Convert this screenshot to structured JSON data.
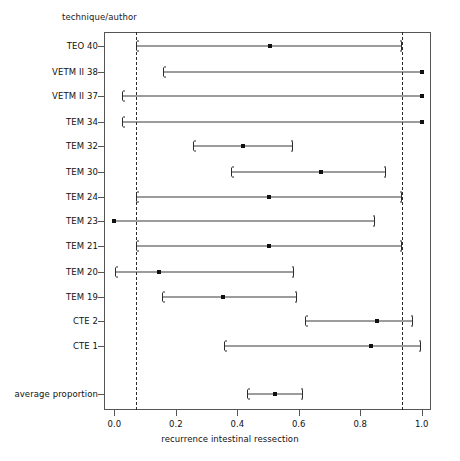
{
  "chart_data": {
    "type": "scatter",
    "title": "",
    "ylabel": "technique/author",
    "xlabel": "recurrence intestinal ressection",
    "xlim": [
      -0.034,
      1.034
    ],
    "xticks": [
      0.0,
      0.2,
      0.4,
      0.6,
      0.8,
      1.0
    ],
    "xtick_labels": [
      "0.0",
      "0.2",
      "0.4",
      "0.6",
      "0.8",
      "1.0"
    ],
    "grid": false,
    "legend": "none",
    "reference_lines": [
      0.07,
      0.936
    ],
    "reference_line_style": "dashed",
    "marker": "filled-square",
    "interval_style": "bracket-capped-line",
    "categories": [
      "TEO 40",
      "VETM II 38",
      "VETM II 37",
      "TEM 34",
      "TEM 32",
      "TEM 30",
      "TEM 24",
      "TEM 23",
      "TEM 21",
      "TEM 20",
      "TEM 19",
      "CTE 2",
      "CTE 1",
      "average proportion"
    ],
    "rows": [
      {
        "label": "TEO 40",
        "estimate": 0.505,
        "low": 0.07,
        "high": 0.935,
        "y": 46.0,
        "cap_low": true,
        "cap_high": true
      },
      {
        "label": "VETM II 38",
        "estimate": 1.0,
        "low": 0.159,
        "high": 1.0,
        "y": 71.7,
        "cap_low": true,
        "cap_high": false
      },
      {
        "label": "VETM II 37",
        "estimate": 1.0,
        "low": 0.026,
        "high": 1.0,
        "y": 96.0,
        "cap_low": true,
        "cap_high": false
      },
      {
        "label": "TEM 34",
        "estimate": 1.0,
        "low": 0.025,
        "high": 1.0,
        "y": 122.3,
        "cap_low": true,
        "cap_high": false
      },
      {
        "label": "TEM 32",
        "estimate": 0.418,
        "low": 0.256,
        "high": 0.582,
        "y": 146.3,
        "cap_low": true,
        "cap_high": true
      },
      {
        "label": "TEM 30",
        "estimate": 0.673,
        "low": 0.379,
        "high": 0.883,
        "y": 171.7,
        "cap_low": true,
        "cap_high": true
      },
      {
        "label": "TEM 24",
        "estimate": 0.503,
        "low": 0.07,
        "high": 0.935,
        "y": 196.7,
        "cap_low": true,
        "cap_high": true
      },
      {
        "label": "TEM 23",
        "estimate": 0.0,
        "low": 0.0,
        "high": 0.847,
        "y": 221.0,
        "cap_low": false,
        "cap_high": true
      },
      {
        "label": "TEM 21",
        "estimate": 0.503,
        "low": 0.07,
        "high": 0.935,
        "y": 246.0,
        "cap_low": true,
        "cap_high": true
      },
      {
        "label": "TEM 20",
        "estimate": 0.145,
        "low": 0.001,
        "high": 0.585,
        "y": 271.7,
        "cap_low": true,
        "cap_high": true
      },
      {
        "label": "TEM 19",
        "estimate": 0.353,
        "low": 0.156,
        "high": 0.594,
        "y": 296.7,
        "cap_low": true,
        "cap_high": true
      },
      {
        "label": "CTE 2",
        "estimate": 0.853,
        "low": 0.619,
        "high": 0.973,
        "y": 321.0,
        "cap_low": true,
        "cap_high": true
      },
      {
        "label": "CTE 1",
        "estimate": 0.834,
        "low": 0.358,
        "high": 0.996,
        "y": 346.0,
        "cap_low": true,
        "cap_high": true
      },
      {
        "label": "average proportion",
        "estimate": 0.521,
        "low": 0.43,
        "high": 0.614,
        "y": 394.0,
        "cap_low": true,
        "cap_high": true
      }
    ],
    "colors": {
      "marker": "#111111",
      "line": "#3a3a3a",
      "frame": "#555555",
      "reference": "#2b2b2b",
      "background": "#ffffff"
    }
  }
}
